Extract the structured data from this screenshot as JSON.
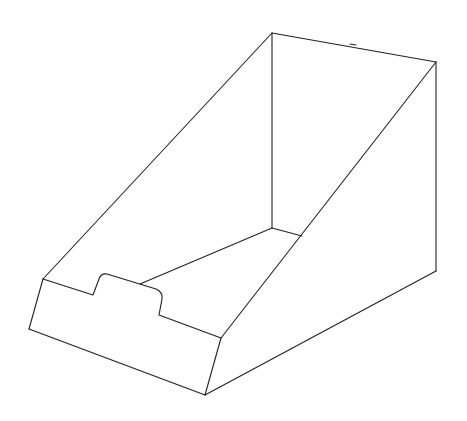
{
  "figure": {
    "background": "#ffffff",
    "stroke_color": "#222222"
  }
}
